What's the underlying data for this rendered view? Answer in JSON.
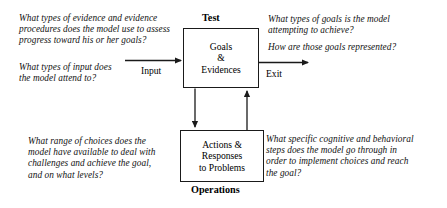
{
  "diagram": {
    "type": "flow-diagram",
    "line_color": "#1a1a1a",
    "background_color": "#ffffff"
  },
  "boxes": {
    "test": {
      "caption": "Test",
      "lines": [
        "Goals",
        "&",
        "Evidences"
      ]
    },
    "operations": {
      "caption": "Operations",
      "lines": [
        "Actions &",
        "Responses",
        "to Problems"
      ]
    }
  },
  "flow_labels": {
    "input": "Input",
    "exit": "Exit"
  },
  "questions": {
    "evidence": {
      "lines": [
        "What types of evidence and evidence",
        "procedures does the model use to assess",
        "progress toward his or her goals?"
      ]
    },
    "input": {
      "lines": [
        "What types of input does",
        "the model attend to?"
      ]
    },
    "goals": {
      "lines_a": [
        "What types of goals is the model",
        "attempting to achieve?"
      ],
      "lines_b": [
        "How are those goals represented?"
      ]
    },
    "choices": {
      "lines": [
        "What range of choices does the",
        "model have available to deal with",
        "challenges and achieve the goal,",
        "and on what levels?"
      ]
    },
    "steps": {
      "lines": [
        "What specific cognitive and behavioral",
        "steps does the model go through in",
        "order to implement choices and reach",
        "the goal?"
      ]
    }
  }
}
